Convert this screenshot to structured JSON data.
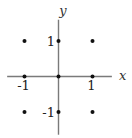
{
  "figure": {
    "background": "#ffffff"
  },
  "chart_data": {
    "type": "scatter",
    "title": "",
    "xlabel": "x",
    "ylabel": "y",
    "points": [
      {
        "x": -1,
        "y": 1
      },
      {
        "x": 0,
        "y": 1
      },
      {
        "x": 1,
        "y": 1
      },
      {
        "x": -1,
        "y": 0
      },
      {
        "x": 0,
        "y": 0
      },
      {
        "x": 1,
        "y": 0
      },
      {
        "x": -1,
        "y": -1
      },
      {
        "x": 0,
        "y": -1
      },
      {
        "x": 1,
        "y": -1
      }
    ],
    "x_ticks": [
      {
        "value": -1,
        "label": "-1"
      },
      {
        "value": 1,
        "label": "1"
      }
    ],
    "y_ticks": [
      {
        "value": 1,
        "label": "1"
      },
      {
        "value": -1,
        "label": "-1"
      }
    ],
    "xlim": [
      -1.51,
      1.57
    ],
    "ylim": [
      -1.64,
      1.6
    ],
    "grid": false,
    "legend": null,
    "colors": {
      "axis": "#7a7a7a",
      "point": "#111111",
      "tick_label": "#222222",
      "axis_label": "#333333"
    }
  }
}
